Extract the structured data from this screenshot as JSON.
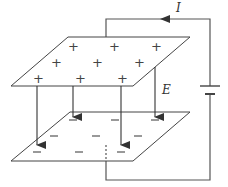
{
  "diagram": {
    "title": "",
    "labels": {
      "current": "I",
      "field": "E"
    },
    "top_plate": {
      "charge_symbol": "+",
      "charge_count": 9
    },
    "bottom_plate": {
      "charge_symbol": "−",
      "charge_count": 9
    },
    "components": [
      "top-plate",
      "bottom-plate",
      "battery",
      "wire",
      "field-lines"
    ],
    "colors": {
      "line": "#444444",
      "background": "#ffffff"
    }
  }
}
